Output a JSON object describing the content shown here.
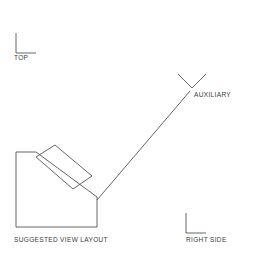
{
  "figure": {
    "caption": "SUGGESTED VIEW LAYOUT",
    "background_color": "#ffffff",
    "line_color": "#555555",
    "text_color": "#3c3c3c"
  },
  "view_markers": [
    {
      "id": "top",
      "label": "TOP",
      "icon": "corner-mark-icon",
      "orientation": "upright",
      "position": {
        "x": 16,
        "y": 33
      }
    },
    {
      "id": "auxiliary",
      "label": "AUXILIARY",
      "icon": "corner-mark-rotated-icon",
      "orientation": "rotated-45",
      "position": {
        "x": 192,
        "y": 74
      }
    },
    {
      "id": "right-side",
      "label": "RIGHT SIDE",
      "icon": "corner-mark-icon",
      "orientation": "upright",
      "position": {
        "x": 186,
        "y": 213
      }
    }
  ],
  "geometry": {
    "object_outline": {
      "name": "object-body-outline",
      "points": "16,152 36,152 97,197 97,227 16,227",
      "description": "Front view body with chamfered upper-right inclined face"
    },
    "inclined_block": {
      "name": "inclined-block-outline",
      "points": "36,157 55,145 92,176 73,189",
      "description": "Rotated rectangular block resting on the inclined surface"
    },
    "leader_line": {
      "name": "auxiliary-leader-line",
      "from": {
        "x": 97,
        "y": 200
      },
      "to": {
        "x": 190,
        "y": 91
      },
      "description": "Sight line from inclined face to auxiliary view marker"
    }
  }
}
